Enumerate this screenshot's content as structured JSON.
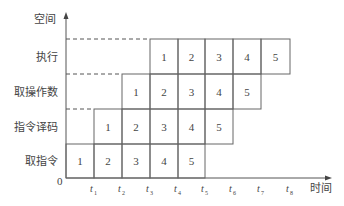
{
  "diagram": {
    "type": "pipeline-space-time",
    "y_axis_label": "空间",
    "x_axis_label": "时间",
    "origin_label": "0",
    "stages": [
      {
        "label": "执行",
        "cells": [
          {
            "t": 4,
            "v": "1"
          },
          {
            "t": 5,
            "v": "2"
          },
          {
            "t": 6,
            "v": "3"
          },
          {
            "t": 7,
            "v": "4"
          },
          {
            "t": 8,
            "v": "5"
          }
        ]
      },
      {
        "label": "取操作数",
        "cells": [
          {
            "t": 3,
            "v": "1"
          },
          {
            "t": 4,
            "v": "2"
          },
          {
            "t": 5,
            "v": "3"
          },
          {
            "t": 6,
            "v": "4"
          },
          {
            "t": 7,
            "v": "5"
          }
        ]
      },
      {
        "label": "指令译码",
        "cells": [
          {
            "t": 2,
            "v": "1"
          },
          {
            "t": 3,
            "v": "2"
          },
          {
            "t": 4,
            "v": "3"
          },
          {
            "t": 5,
            "v": "4"
          },
          {
            "t": 6,
            "v": "5"
          }
        ]
      },
      {
        "label": "取指令",
        "cells": [
          {
            "t": 1,
            "v": "1"
          },
          {
            "t": 2,
            "v": "2"
          },
          {
            "t": 3,
            "v": "3"
          },
          {
            "t": 4,
            "v": "4"
          },
          {
            "t": 5,
            "v": "5"
          }
        ]
      }
    ],
    "time_ticks": [
      {
        "base": "t",
        "sub": "1"
      },
      {
        "base": "t",
        "sub": "2"
      },
      {
        "base": "t",
        "sub": "3"
      },
      {
        "base": "t",
        "sub": "4"
      },
      {
        "base": "t",
        "sub": "5"
      },
      {
        "base": "t",
        "sub": "6"
      },
      {
        "base": "t",
        "sub": "7"
      },
      {
        "base": "t",
        "sub": "8"
      }
    ]
  }
}
